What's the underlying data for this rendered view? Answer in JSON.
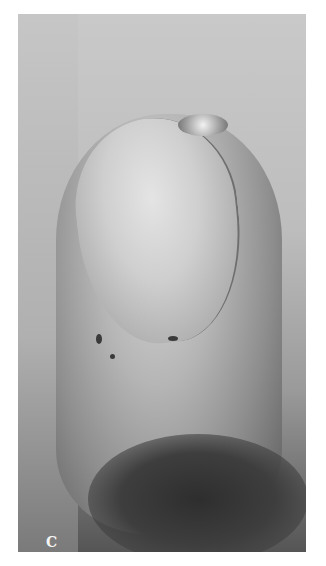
{
  "figure": {
    "panel_label": "C",
    "colors": {
      "background": "#ffffff",
      "photo_light": "#c9c9c9",
      "photo_dark": "#3a3a3a",
      "label": "#f4f4f4"
    }
  }
}
